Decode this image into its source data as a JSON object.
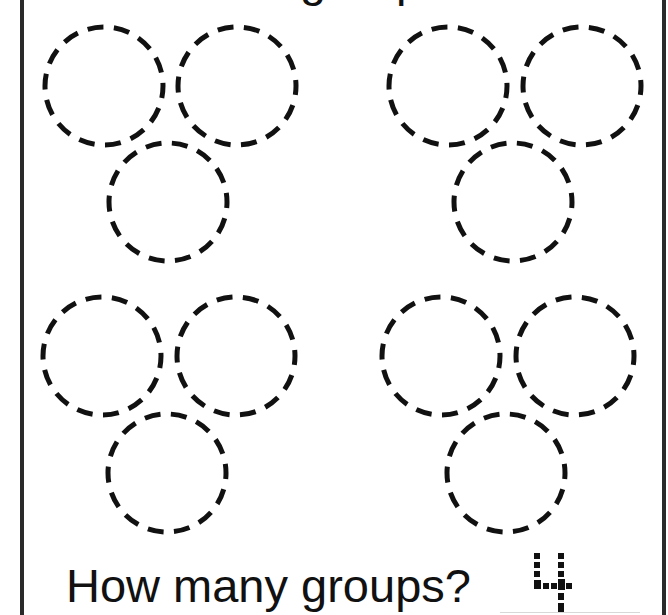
{
  "worksheet": {
    "heading_partial": "groups",
    "question": "How many groups?",
    "answer": "4",
    "ink_color": "#111111",
    "border_color": "#2a2a2a"
  },
  "groups": [
    {
      "name": "group-1",
      "circles": [
        {
          "cx": 104,
          "cy": 86,
          "r": 59
        },
        {
          "cx": 237,
          "cy": 86,
          "r": 59
        },
        {
          "cx": 168,
          "cy": 202,
          "r": 59
        }
      ]
    },
    {
      "name": "group-2",
      "circles": [
        {
          "cx": 448,
          "cy": 86,
          "r": 59
        },
        {
          "cx": 582,
          "cy": 86,
          "r": 59
        },
        {
          "cx": 513,
          "cy": 202,
          "r": 59
        }
      ]
    },
    {
      "name": "group-3",
      "circles": [
        {
          "cx": 102,
          "cy": 356,
          "r": 59
        },
        {
          "cx": 236,
          "cy": 356,
          "r": 59
        },
        {
          "cx": 167,
          "cy": 473,
          "r": 59
        }
      ]
    },
    {
      "name": "group-4",
      "circles": [
        {
          "cx": 441,
          "cy": 356,
          "r": 59
        },
        {
          "cx": 575,
          "cy": 356,
          "r": 59
        },
        {
          "cx": 506,
          "cy": 473,
          "r": 59
        }
      ]
    }
  ]
}
